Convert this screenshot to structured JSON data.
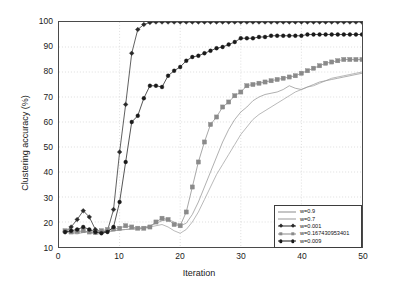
{
  "chart_data": {
    "type": "line",
    "title": "",
    "xlabel": "Iteration",
    "ylabel": "Clustering accuracy (%)",
    "xlim": [
      0,
      50
    ],
    "ylim": [
      10,
      100
    ],
    "xticks": [
      0,
      10,
      20,
      30,
      40,
      50
    ],
    "yticks": [
      10,
      20,
      30,
      40,
      50,
      60,
      70,
      80,
      90,
      100
    ],
    "grid": true,
    "legend_position": "lower right",
    "x": [
      1,
      2,
      3,
      4,
      5,
      6,
      7,
      8,
      9,
      10,
      11,
      12,
      13,
      14,
      15,
      16,
      17,
      18,
      19,
      20,
      21,
      22,
      23,
      24,
      25,
      26,
      27,
      28,
      29,
      30,
      31,
      32,
      33,
      34,
      35,
      36,
      37,
      38,
      39,
      40,
      41,
      42,
      43,
      44,
      45,
      46,
      47,
      48,
      49,
      50
    ],
    "series": [
      {
        "name": "w=0.9",
        "color": "#8c8c8c",
        "marker": "none",
        "linestyle": "solid",
        "values": [
          16.5,
          16.0,
          15.8,
          16.2,
          16.0,
          15.5,
          16.0,
          16.2,
          16.5,
          16.8,
          17.0,
          17.2,
          17.5,
          17.8,
          18.5,
          19.5,
          20.5,
          21.0,
          20.0,
          18.5,
          19.5,
          23.0,
          28.0,
          34.0,
          40.0,
          46.0,
          52.0,
          57.0,
          61.0,
          64.0,
          66.0,
          68.5,
          70.0,
          71.0,
          71.5,
          72.0,
          73.0,
          74.5,
          73.5,
          73.0,
          74.0,
          75.0,
          76.0,
          76.5,
          77.0,
          77.5,
          78.0,
          78.5,
          79.0,
          79.5
        ]
      },
      {
        "name": "w=0.7",
        "color": "#9a9a9a",
        "marker": "none",
        "linestyle": "solid",
        "values": [
          16.0,
          15.5,
          15.2,
          15.8,
          16.0,
          15.0,
          15.5,
          16.0,
          16.5,
          16.8,
          17.0,
          17.2,
          17.0,
          17.5,
          18.0,
          18.5,
          19.0,
          18.0,
          16.5,
          15.5,
          17.0,
          20.0,
          24.0,
          29.0,
          34.0,
          39.0,
          43.0,
          47.0,
          51.0,
          55.0,
          58.0,
          61.0,
          63.0,
          64.5,
          66.0,
          67.5,
          69.0,
          70.5,
          72.0,
          73.0,
          74.0,
          74.5,
          75.5,
          76.5,
          77.5,
          78.0,
          78.5,
          79.0,
          79.5,
          80.0
        ]
      },
      {
        "name": "w=0.001",
        "color": "#2a2a2a",
        "marker": "diamond",
        "linestyle": "solid",
        "values": [
          16.0,
          18.0,
          21.0,
          24.5,
          22.0,
          17.0,
          16.0,
          16.5,
          25.0,
          48.0,
          67.0,
          87.5,
          97.0,
          99.0,
          99.8,
          100,
          100,
          100,
          100,
          100,
          100,
          100,
          100,
          100,
          100,
          100,
          100,
          100,
          100,
          100,
          100,
          100,
          100,
          100,
          100,
          100,
          100,
          100,
          100,
          100,
          100,
          100,
          100,
          100,
          100,
          100,
          100,
          100,
          100,
          100
        ]
      },
      {
        "name": "w=0.167430953401",
        "color": "#8a8a8a",
        "marker": "square",
        "linestyle": "solid",
        "values": [
          16.5,
          16.0,
          16.2,
          16.5,
          16.0,
          15.8,
          16.5,
          17.0,
          17.2,
          17.5,
          18.5,
          18.0,
          17.5,
          17.5,
          18.0,
          20.0,
          21.5,
          21.0,
          19.0,
          18.5,
          24.0,
          34.0,
          44.0,
          52.0,
          59.0,
          62.0,
          66.0,
          68.0,
          70.5,
          72.0,
          74.5,
          75.0,
          75.5,
          76.0,
          76.5,
          77.0,
          77.5,
          78.0,
          78.5,
          79.5,
          80.5,
          81.5,
          82.5,
          83.5,
          84.0,
          84.5,
          85.0,
          85.0,
          85.0,
          85.0
        ]
      },
      {
        "name": "w=0.009",
        "color": "#1a1a1a",
        "marker": "circle",
        "linestyle": "solid",
        "values": [
          16.0,
          16.5,
          17.0,
          18.0,
          17.0,
          16.0,
          15.5,
          16.0,
          18.0,
          28.0,
          44.0,
          60.0,
          62.5,
          69.5,
          74.5,
          74.5,
          74.0,
          78.5,
          80.5,
          82.0,
          84.5,
          86.0,
          86.5,
          87.5,
          88.5,
          89.5,
          90.0,
          91.0,
          92.0,
          93.5,
          93.5,
          93.5,
          94.0,
          94.0,
          94.5,
          94.5,
          94.5,
          94.5,
          94.5,
          94.5,
          95.0,
          95.0,
          95.0,
          95.0,
          95.0,
          95.0,
          95.0,
          95.0,
          95.0,
          95.0
        ]
      }
    ]
  }
}
